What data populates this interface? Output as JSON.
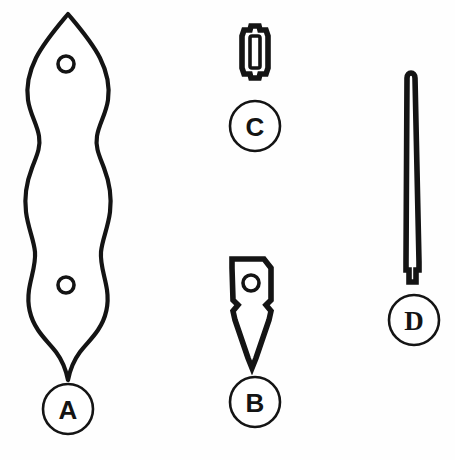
{
  "plate": {
    "background_color": "#fefefe",
    "ink_color": "#141414",
    "width": 455,
    "height": 460,
    "caption": ""
  },
  "artifacts": [
    {
      "id": "A",
      "label": "A",
      "name": "symmetrical-waisted-plaque",
      "description": "Long symmetrical double-lobed plaque with ogival top, two circular perforations and pointed barbed base",
      "hole_count": 2,
      "label_position": {
        "cx": 68,
        "cy": 409,
        "r": 25
      },
      "label_font": "sans"
    },
    {
      "id": "B",
      "label": "B",
      "name": "perforated-blade-point",
      "description": "Rectangular hafting plate with single perforation, barbed shoulders and sharp tapering point",
      "hole_count": 1,
      "label_position": {
        "cx": 255,
        "cy": 402,
        "r": 25
      },
      "label_font": "sans"
    },
    {
      "id": "C",
      "label": "C",
      "name": "small-slotted-ferrule",
      "description": "Small thick-walled rectangular ferrule with narrow inner slot and notched tabs at each end",
      "hole_count": 0,
      "label_position": {
        "cx": 255,
        "cy": 126,
        "r": 25
      },
      "label_font": "sans"
    },
    {
      "id": "D",
      "label": "D",
      "name": "tapered-rod-awl",
      "description": "Long slender tapered rod with rounded tip and stepped tang at the base",
      "hole_count": 0,
      "label_position": {
        "cx": 414,
        "cy": 320,
        "r": 25
      },
      "label_font": "serif"
    }
  ]
}
